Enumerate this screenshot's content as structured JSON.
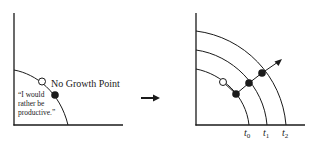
{
  "left_panel": {
    "point_label": "No Growth Point",
    "quote_lines": [
      "“I would",
      "rather be",
      "productive.”"
    ]
  },
  "transition_arrow": "right-arrow",
  "right_panel": {
    "curve_labels": [
      {
        "base": "t",
        "sub": "0"
      },
      {
        "base": "t",
        "sub": "1"
      },
      {
        "base": "t",
        "sub": "2"
      }
    ]
  },
  "colors": {
    "ink": "#1a1a1a",
    "background": "#ffffff"
  }
}
